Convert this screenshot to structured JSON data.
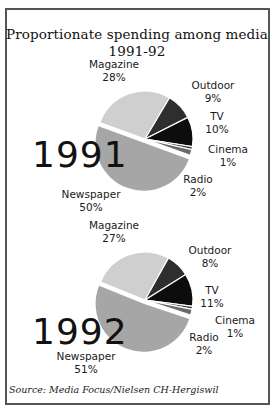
{
  "chart_data": {
    "type": "pie",
    "title": "Proportionate spending among media",
    "subtitle": "1991-92",
    "source": "Source: Media Focus/Nielsen CH-Hergiswil",
    "charts": [
      {
        "year": "1991",
        "categories": [
          "Magazine",
          "Outdoor",
          "TV",
          "Cinema",
          "Radio",
          "Newspaper"
        ],
        "values": [
          28,
          9,
          10,
          1,
          2,
          50
        ],
        "unit": "%",
        "exploded": "Newspaper"
      },
      {
        "year": "1992",
        "categories": [
          "Magazine",
          "Outdoor",
          "TV",
          "Cinema",
          "Radio",
          "Newspaper"
        ],
        "values": [
          27,
          8,
          11,
          1,
          2,
          51
        ],
        "unit": "%",
        "exploded": "Newspaper"
      }
    ],
    "colors": {
      "Magazine": "#cfcfcf",
      "Outdoor": "#2e2e2e",
      "TV": "#0d0d0d",
      "Cinema": "#3a3a3a",
      "Radio": "#6a6a6a",
      "Newspaper": "#a6a6a6"
    }
  },
  "header": {
    "title": "Proportionate spending among media",
    "subtitle": "1991-92"
  },
  "pie1": {
    "year": "1991",
    "labels": {
      "magazine": {
        "name": "Magazine",
        "pct": "28%"
      },
      "outdoor": {
        "name": "Outdoor",
        "pct": "9%"
      },
      "tv": {
        "name": "TV",
        "pct": "10%"
      },
      "cinema": {
        "name": "Cinema",
        "pct": "1%"
      },
      "radio": {
        "name": "Radio",
        "pct": "2%"
      },
      "newspaper": {
        "name": "Newspaper",
        "pct": "50%"
      }
    }
  },
  "pie2": {
    "year": "1992",
    "labels": {
      "magazine": {
        "name": "Magazine",
        "pct": "27%"
      },
      "outdoor": {
        "name": "Outdoor",
        "pct": "8%"
      },
      "tv": {
        "name": "TV",
        "pct": "11%"
      },
      "cinema": {
        "name": "Cinema",
        "pct": "1%"
      },
      "radio": {
        "name": "Radio",
        "pct": "2%"
      },
      "newspaper": {
        "name": "Newspaper",
        "pct": "51%"
      }
    }
  },
  "footer": {
    "source": "Source: Media Focus/Nielsen CH-Hergiswil"
  }
}
